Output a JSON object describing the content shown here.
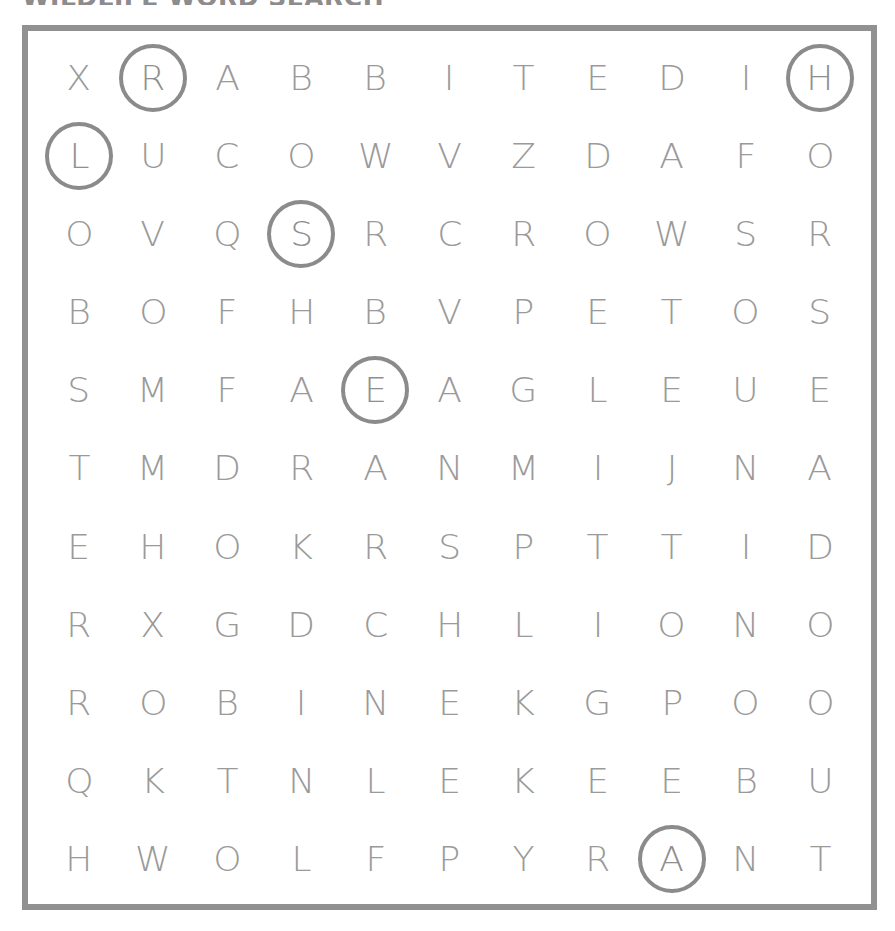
{
  "title": "WILDLIFE WORD SEARCH",
  "frame": {
    "border_color": "#919191",
    "background_color": "#ffffff"
  },
  "colors": {
    "letter": "#9a9a9a",
    "circle": "#8b8b8b",
    "border": "#919191"
  },
  "grid": {
    "rows": 11,
    "columns": 11,
    "letters": [
      [
        "X",
        "R",
        "A",
        "B",
        "B",
        "I",
        "T",
        "E",
        "D",
        "I",
        "H"
      ],
      [
        "L",
        "U",
        "C",
        "O",
        "W",
        "V",
        "Z",
        "D",
        "A",
        "F",
        "O"
      ],
      [
        "O",
        "V",
        "Q",
        "S",
        "R",
        "C",
        "R",
        "O",
        "W",
        "S",
        "R"
      ],
      [
        "B",
        "O",
        "F",
        "H",
        "B",
        "V",
        "P",
        "E",
        "T",
        "O",
        "S"
      ],
      [
        "S",
        "M",
        "F",
        "A",
        "E",
        "A",
        "G",
        "L",
        "E",
        "U",
        "E"
      ],
      [
        "T",
        "M",
        "D",
        "R",
        "A",
        "N",
        "M",
        "I",
        "J",
        "N",
        "A"
      ],
      [
        "E",
        "H",
        "O",
        "K",
        "R",
        "S",
        "P",
        "T",
        "T",
        "I",
        "D"
      ],
      [
        "R",
        "X",
        "G",
        "D",
        "C",
        "H",
        "L",
        "I",
        "O",
        "N",
        "O"
      ],
      [
        "R",
        "O",
        "B",
        "I",
        "N",
        "E",
        "K",
        "G",
        "P",
        "O",
        "O"
      ],
      [
        "Q",
        "K",
        "T",
        "N",
        "L",
        "E",
        "K",
        "E",
        "E",
        "B",
        "U"
      ],
      [
        "H",
        "W",
        "O",
        "L",
        "F",
        "P",
        "Y",
        "R",
        "A",
        "N",
        "T"
      ]
    ],
    "circled": [
      {
        "row": 0,
        "col": 1,
        "letter": "R"
      },
      {
        "row": 0,
        "col": 10,
        "letter": "H"
      },
      {
        "row": 1,
        "col": 0,
        "letter": "L"
      },
      {
        "row": 2,
        "col": 3,
        "letter": "S"
      },
      {
        "row": 4,
        "col": 4,
        "letter": "E"
      },
      {
        "row": 10,
        "col": 8,
        "letter": "A"
      }
    ]
  }
}
